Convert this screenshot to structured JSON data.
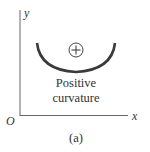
{
  "figure": {
    "label": "(a)",
    "axes": {
      "x_label": "x",
      "y_label": "y",
      "origin_label": "O"
    },
    "curve": {
      "shape": "concave-up arc",
      "sign_symbol": "+",
      "caption_line1": "Positive",
      "caption_line2": "curvature"
    },
    "colors": {
      "axis": "#555555",
      "curve": "#333333",
      "text": "#333333"
    }
  }
}
